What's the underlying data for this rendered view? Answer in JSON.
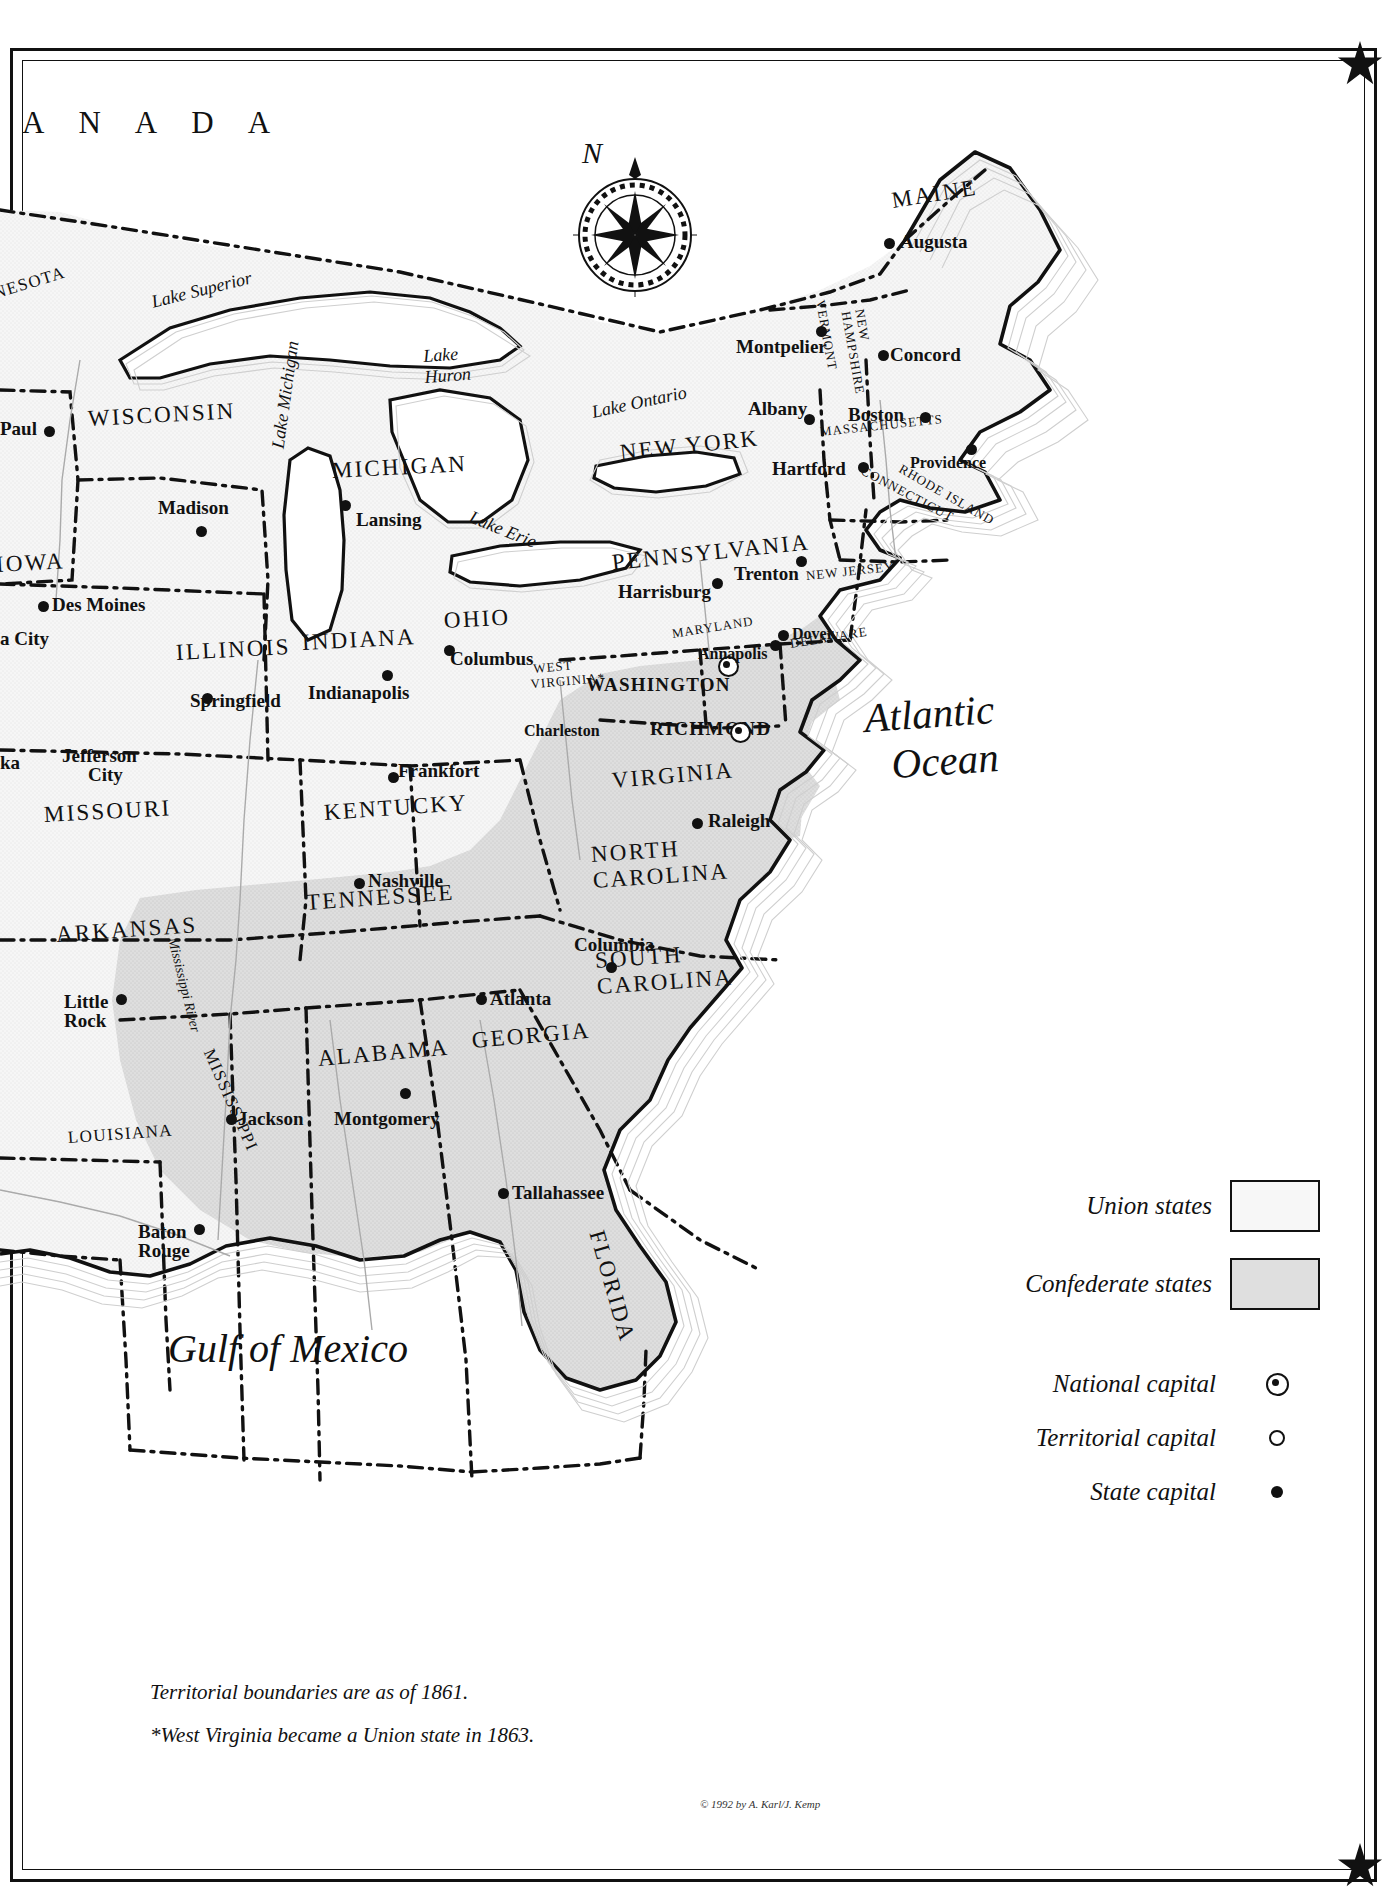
{
  "map": {
    "title_country": "A N A D A",
    "ocean_label": "Atlantic\nOcean",
    "gulf_label": "Gulf of Mexico",
    "compass_letter": "N"
  },
  "water_labels": [
    {
      "name": "Lake Superior",
      "text": "Lake Superior"
    },
    {
      "name": "Lake Huron",
      "text": "Lake\nHuron"
    },
    {
      "name": "Lake Michigan",
      "text": "Lake Michigan"
    },
    {
      "name": "Lake Erie",
      "text": "Lake Erie"
    },
    {
      "name": "Lake Ontario",
      "text": "Lake Ontario"
    },
    {
      "name": "Mississippi River",
      "text": "Mississippi River"
    }
  ],
  "states": [
    {
      "label": "NESOTA",
      "status": "union"
    },
    {
      "label": "WISCONSIN",
      "status": "union"
    },
    {
      "label": "MICHIGAN",
      "status": "union"
    },
    {
      "label": "IOWA",
      "status": "union"
    },
    {
      "label": "ILLINOIS",
      "status": "union"
    },
    {
      "label": "INDIANA",
      "status": "union"
    },
    {
      "label": "OHIO",
      "status": "union"
    },
    {
      "label": "MISSOURI",
      "status": "union"
    },
    {
      "label": "KENTUCKY",
      "status": "union"
    },
    {
      "label": "ARKANSAS",
      "status": "confederate"
    },
    {
      "label": "TENNESSEE",
      "status": "confederate"
    },
    {
      "label": "MISSISSIPPI",
      "status": "confederate"
    },
    {
      "label": "ALABAMA",
      "status": "confederate"
    },
    {
      "label": "GEORGIA",
      "status": "confederate"
    },
    {
      "label": "LOUISIANA",
      "status": "confederate"
    },
    {
      "label": "FLORIDA",
      "status": "confederate"
    },
    {
      "label": "SOUTH\nCAROLINA",
      "status": "confederate"
    },
    {
      "label": "NORTH\nCAROLINA",
      "status": "confederate"
    },
    {
      "label": "VIRGINIA",
      "status": "confederate"
    },
    {
      "label": "WEST\nVIRGINIA*",
      "status": "union"
    },
    {
      "label": "MARYLAND",
      "status": "union"
    },
    {
      "label": "DELAWARE",
      "status": "union"
    },
    {
      "label": "NEW JERSEY",
      "status": "union"
    },
    {
      "label": "PENNSYLVANIA",
      "status": "union"
    },
    {
      "label": "NEW YORK",
      "status": "union"
    },
    {
      "label": "VERMONT",
      "status": "union"
    },
    {
      "label": "NEW\nHAMPSHIRE",
      "status": "union"
    },
    {
      "label": "MASSACHUSETTS",
      "status": "union"
    },
    {
      "label": "CONNECTICUT",
      "status": "union"
    },
    {
      "label": "RHODE ISLAND",
      "status": "union"
    },
    {
      "label": "MAINE",
      "status": "union"
    }
  ],
  "cities": [
    {
      "name": "Paul",
      "type": "state-capital"
    },
    {
      "name": "Madison",
      "type": "state-capital"
    },
    {
      "name": "Lansing",
      "type": "state-capital"
    },
    {
      "name": "Des Moines",
      "type": "state-capital"
    },
    {
      "name": "a City",
      "type": "state-capital"
    },
    {
      "name": "Springfield",
      "type": "state-capital"
    },
    {
      "name": "Indianapolis",
      "type": "state-capital"
    },
    {
      "name": "Columbus",
      "type": "state-capital"
    },
    {
      "name": "Jefferson\nCity",
      "type": "state-capital"
    },
    {
      "name": "ka",
      "type": "state-capital"
    },
    {
      "name": "Frankfort",
      "type": "state-capital"
    },
    {
      "name": "Charleston",
      "type": "state-capital"
    },
    {
      "name": "Nashville",
      "type": "state-capital"
    },
    {
      "name": "Little\nRock",
      "type": "state-capital"
    },
    {
      "name": "Jackson",
      "type": "state-capital"
    },
    {
      "name": "Montgomery",
      "type": "state-capital"
    },
    {
      "name": "Baton\nRouge",
      "type": "state-capital"
    },
    {
      "name": "Tallahassee",
      "type": "state-capital"
    },
    {
      "name": "Atlanta",
      "type": "state-capital"
    },
    {
      "name": "Columbia",
      "type": "state-capital"
    },
    {
      "name": "Raleigh",
      "type": "state-capital"
    },
    {
      "name": "RICHMOND",
      "type": "national-capital"
    },
    {
      "name": "WASHINGTON",
      "type": "national-capital"
    },
    {
      "name": "Annapolis",
      "type": "state-capital"
    },
    {
      "name": "Dover",
      "type": "state-capital"
    },
    {
      "name": "Trenton",
      "type": "state-capital"
    },
    {
      "name": "Harrisburg",
      "type": "state-capital"
    },
    {
      "name": "Albany",
      "type": "state-capital"
    },
    {
      "name": "Montpelier",
      "type": "state-capital"
    },
    {
      "name": "Concord",
      "type": "state-capital"
    },
    {
      "name": "Boston",
      "type": "state-capital"
    },
    {
      "name": "Hartford",
      "type": "state-capital"
    },
    {
      "name": "Providence",
      "type": "state-capital"
    },
    {
      "name": "Augusta",
      "type": "state-capital"
    }
  ],
  "legend": {
    "union_label": "Union states",
    "confederate_label": "Confederate states",
    "national_capital_label": "National capital",
    "territorial_capital_label": "Territorial capital",
    "state_capital_label": "State capital",
    "union_color": "#f7f7f7",
    "confederate_color": "#dfdfdf"
  },
  "notes": {
    "line1": "Territorial boundaries are as of 1861.",
    "line2": "*West Virginia became a Union state in 1863."
  },
  "copyright": "© 1992 by A. Karl/J. Kemp"
}
